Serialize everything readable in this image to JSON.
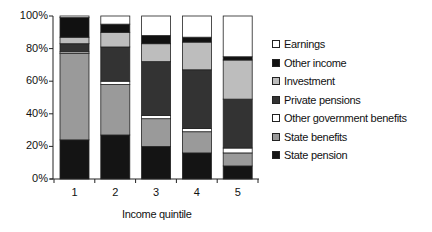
{
  "chart_data": {
    "type": "bar",
    "stacked": true,
    "percent": true,
    "title": "",
    "xlabel": "Income quintile",
    "ylabel": "",
    "ylim": [
      0,
      100
    ],
    "yticks": [
      "0%",
      "20%",
      "40%",
      "60%",
      "80%",
      "100%"
    ],
    "categories": [
      "1",
      "2",
      "3",
      "4",
      "5"
    ],
    "series": [
      {
        "name": "State pension",
        "color": "#141414",
        "values": [
          24,
          27,
          20,
          16,
          8
        ]
      },
      {
        "name": "State benefits",
        "color": "#9a9a9a",
        "values": [
          53,
          31,
          17,
          13,
          8
        ]
      },
      {
        "name": "Other government benefits",
        "color": "#ffffff",
        "values": [
          1,
          2,
          2,
          2,
          3
        ]
      },
      {
        "name": "Private pensions",
        "color": "#333333",
        "values": [
          5,
          21,
          33,
          36,
          30
        ]
      },
      {
        "name": "Investment",
        "color": "#bdbdbd",
        "values": [
          4,
          9,
          11,
          17,
          24
        ]
      },
      {
        "name": "Other income",
        "color": "#111111",
        "values": [
          12,
          5,
          5,
          3,
          2
        ]
      },
      {
        "name": "Earnings",
        "color": "#ffffff",
        "values": [
          1,
          5,
          12,
          13,
          25
        ]
      }
    ],
    "legend": {
      "position": "right",
      "order": [
        "Earnings",
        "Other income",
        "Investment",
        "Private pensions",
        "Other government benefits",
        "State benefits",
        "State pension"
      ]
    },
    "grid": false
  }
}
